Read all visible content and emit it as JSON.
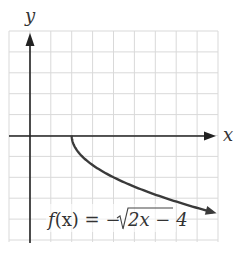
{
  "chart_data": {
    "type": "line",
    "title": "",
    "xlabel": "x",
    "ylabel": "y",
    "annotation": "f(x) = −√(2x − 4)",
    "xlim": [
      -1,
      9
    ],
    "ylim": [
      -5,
      5
    ],
    "grid": true,
    "series": [
      {
        "name": "f(x) = -sqrt(2x - 4)",
        "x": [
          2,
          2.5,
          3,
          4,
          5,
          6,
          7,
          8,
          8.8
        ],
        "y": [
          0,
          -1,
          -1.41,
          -2,
          -2.45,
          -2.83,
          -3.16,
          -3.46,
          -3.69
        ]
      }
    ]
  },
  "labels": {
    "x_axis": "x",
    "y_axis": "y",
    "f": "f",
    "formula_left": "(x) = −",
    "formula_radicand": "2x − 4"
  },
  "colors": {
    "grid": "#d9d9d9",
    "axis": "#222222",
    "curve": "#3a3a3a"
  }
}
